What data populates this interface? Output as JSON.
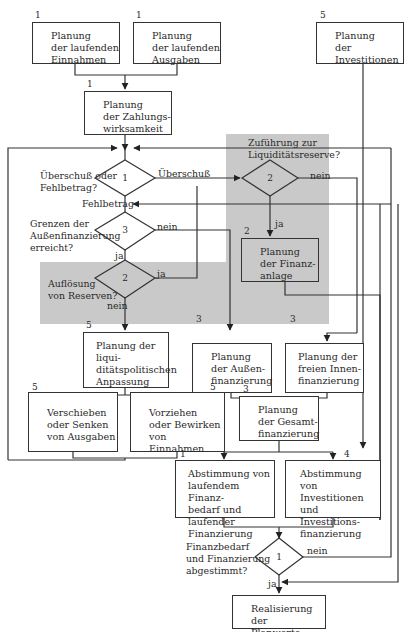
{
  "diagram": {
    "type": "flowchart",
    "language": "de",
    "shaded_regions": [
      {
        "id": "zufuehrung",
        "color": "#c9c9c9"
      },
      {
        "id": "aufloesung",
        "color": "#c9c9c9"
      }
    ],
    "boxes": {
      "einnahmen": {
        "num": "1",
        "text": "Planung\nder laufenden\nEinnahmen"
      },
      "ausgaben": {
        "num": "1",
        "text": "Planung\nder laufenden\nAusgaben"
      },
      "investitionen": {
        "num": "5",
        "text": "Planung\nder\nInvestitionen"
      },
      "zahlungswirksamkeit": {
        "num": "1",
        "text": "Planung\nder Zahlungs-\nwirksamkeit"
      },
      "finanzanlage": {
        "num": "2",
        "text": "Planung\nder Finanz-\nanlage"
      },
      "liquiditaetspolitisch": {
        "num": "5",
        "text": "Planung der liqui-\nditätspolitischen\nAnpassung"
      },
      "aussenfinanzierung": {
        "num": "3",
        "text": "Planung\nder Außen-\nfinanzierung"
      },
      "innenfinanzierung": {
        "num": "3",
        "text": "Planung der\nfreien Innen-\nfinanzierung"
      },
      "verschieben": {
        "num": "5",
        "text": "Verschieben\noder Senken\nvon Ausgaben"
      },
      "vorziehen": {
        "num": "5",
        "text": "Vorziehen\noder Bewirken\nvon Einnahmen"
      },
      "gesamtfinanzierung": {
        "num": "3",
        "text": "Planung\nder Gesamt-\nfinanzierung"
      },
      "abstimmung_laufend": {
        "num": "1",
        "text": "Abstimmung von\nlaufendem Finanz-\nbedarf und laufender\nFinanzierung"
      },
      "abstimmung_invest": {
        "num": "4",
        "text": "Abstimmung von\nInvestitionen\nund Investitions-\nfinanzierung"
      },
      "realisierung": {
        "text": "Realisierung der\nPlanwerte"
      }
    },
    "decisions": {
      "d_ueberschuss": {
        "num": "1",
        "question": "Überschuß oder\nFehlbetrag?",
        "out_right": "Überschuß",
        "out_down": "Fehlbetrag"
      },
      "d_grenzen": {
        "num": "3",
        "question": "Grenzen der\nAußenfinanzierung\nerreicht?",
        "out_right": "nein",
        "out_down": "ja"
      },
      "d_zufuehrung": {
        "num": "2",
        "question": "Zuführung zur\nLiquiditätsreserve?",
        "out_right": "nein",
        "out_down": "ja"
      },
      "d_aufloesung": {
        "num": "2",
        "question": "Auflösung\nvon Reserven?",
        "out_right": "ja",
        "out_down": "nein"
      },
      "d_abgestimmt": {
        "num": "1",
        "question": "Finanzbedarf\nund Finanzierung\nabgestimmt?",
        "out_right": "nein",
        "out_down": "ja"
      }
    }
  }
}
